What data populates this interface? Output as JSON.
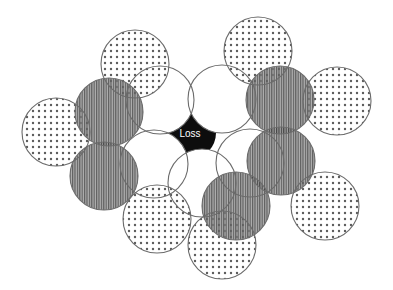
{
  "diagram": {
    "center_label": "Loss",
    "colors": {
      "stroke": "#6b6b6b",
      "white_fill": "#ffffff",
      "dot_color": "#444444",
      "stripe_color": "#3a3a3a",
      "stripe_bg": "#9a9a9a",
      "center_fill": "#0d0d0d",
      "label_color": "#ffffff"
    },
    "circles": [
      {
        "id": "white-1",
        "pattern": "white",
        "cx": 160,
        "cy": 100,
        "r": 34
      },
      {
        "id": "white-2",
        "pattern": "white",
        "cx": 222,
        "cy": 99,
        "r": 34
      },
      {
        "id": "white-3",
        "pattern": "white",
        "cx": 154,
        "cy": 164,
        "r": 34
      },
      {
        "id": "white-4",
        "pattern": "white",
        "cx": 202,
        "cy": 183,
        "r": 34
      },
      {
        "id": "white-5",
        "pattern": "white",
        "cx": 250,
        "cy": 163,
        "r": 34
      },
      {
        "id": "dotted-1",
        "pattern": "dotted",
        "cx": 135,
        "cy": 64,
        "r": 34
      },
      {
        "id": "dotted-2",
        "pattern": "dotted",
        "cx": 258,
        "cy": 51,
        "r": 34
      },
      {
        "id": "dotted-3",
        "pattern": "dotted",
        "cx": 56,
        "cy": 132,
        "r": 34
      },
      {
        "id": "dotted-4",
        "pattern": "dotted",
        "cx": 337,
        "cy": 101,
        "r": 34
      },
      {
        "id": "dotted-5",
        "pattern": "dotted",
        "cx": 157,
        "cy": 219,
        "r": 34
      },
      {
        "id": "dotted-6",
        "pattern": "dotted",
        "cx": 325,
        "cy": 206,
        "r": 34
      },
      {
        "id": "dotted-7",
        "pattern": "dotted",
        "cx": 222,
        "cy": 245,
        "r": 34
      },
      {
        "id": "striped-1",
        "pattern": "striped",
        "cx": 109,
        "cy": 112,
        "r": 34
      },
      {
        "id": "striped-2",
        "pattern": "striped",
        "cx": 280,
        "cy": 100,
        "r": 34
      },
      {
        "id": "striped-3",
        "pattern": "striped",
        "cx": 104,
        "cy": 176,
        "r": 34
      },
      {
        "id": "striped-4",
        "pattern": "striped",
        "cx": 281,
        "cy": 161,
        "r": 34
      },
      {
        "id": "striped-5",
        "pattern": "striped",
        "cx": 236,
        "cy": 206,
        "r": 34
      }
    ],
    "center": {
      "cx": 190,
      "cy": 133
    }
  }
}
